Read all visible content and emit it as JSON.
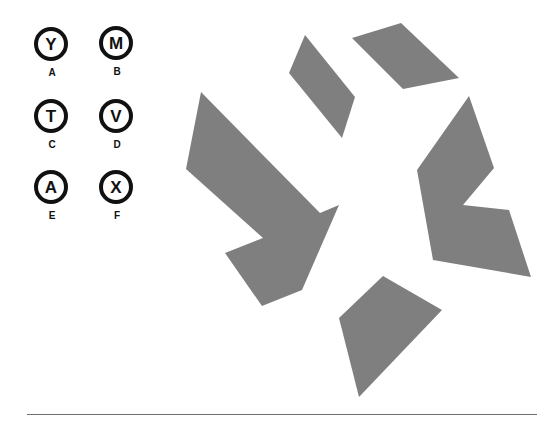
{
  "options": [
    {
      "label": "A",
      "letter": "Y"
    },
    {
      "label": "B",
      "letter": "M"
    },
    {
      "label": "C",
      "letter": "T"
    },
    {
      "label": "D",
      "letter": "V"
    },
    {
      "label": "E",
      "letter": "A"
    },
    {
      "label": "F",
      "letter": "X"
    }
  ],
  "figure": {
    "fill_color": "#7f7f7f",
    "shape_count": 5
  }
}
